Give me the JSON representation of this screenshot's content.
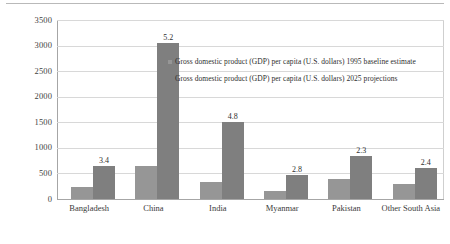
{
  "chart_data": {
    "type": "bar",
    "title": "",
    "xlabel": "",
    "ylabel": "",
    "ylim": [
      0,
      3500
    ],
    "ytick_step": 500,
    "grid": true,
    "legend_position": "inside-upper-right",
    "categories": [
      "Bangladesh",
      "China",
      "India",
      "Myanmar",
      "Pakistan",
      "Other South Asia"
    ],
    "yticks": [
      "0",
      "500",
      "1000",
      "1500",
      "2000",
      "2500",
      "3000",
      "3500"
    ],
    "series": [
      {
        "name": "Gross domestic product (GDP) per capita (U.S. dollars) 1995 baseline estimate",
        "color": "#969696",
        "values": [
          230,
          640,
          340,
          160,
          400,
          290
        ],
        "point_labels": [
          "",
          "",
          "",
          "",
          "",
          ""
        ]
      },
      {
        "name": "Gross domestic product (GDP) per capita (U.S. dollars) 2025 projections",
        "color": "#7f7f7f",
        "values": [
          640,
          3050,
          1500,
          460,
          850,
          600
        ],
        "point_labels": [
          "3.4",
          "5.2",
          "4.8",
          "2.8",
          "2.3",
          "2.4"
        ]
      }
    ],
    "annotations_note": "Values above the 2025 bars are growth multiples relative to the 1995 baseline."
  }
}
